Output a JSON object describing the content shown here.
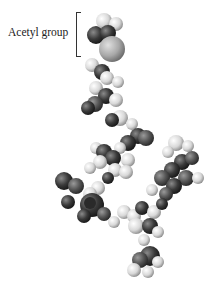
{
  "diagram": {
    "type": "space-filling molecular model",
    "annotation": {
      "label": "Acetyl group"
    },
    "colors": {
      "background": "#ffffff",
      "carbon": "#3a3a3a",
      "hydrogen": "#e8e8e8",
      "oxygen": "#5a5a5a",
      "sulfur": "#a8a8a8",
      "text": "#222222"
    }
  }
}
